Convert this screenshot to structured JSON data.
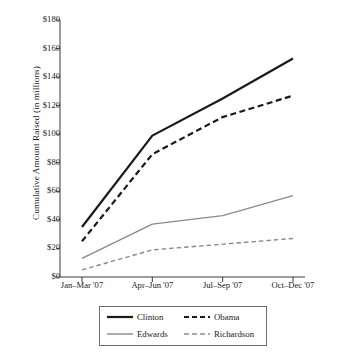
{
  "chart_data": {
    "type": "line",
    "title": "",
    "xlabel": "",
    "ylabel": "Cumulative Amount Raised (in millions)",
    "categories": [
      "Jan–Mar '07",
      "Apr–Jun '07",
      "Jul–Sep '07",
      "Oct–Dec '07"
    ],
    "ylim": [
      0,
      180
    ],
    "ytick_labels": [
      "$0",
      "$20",
      "$40",
      "$60",
      "$80",
      "$100",
      "$120",
      "$140",
      "$160",
      "$180"
    ],
    "ytick_values": [
      0,
      20,
      40,
      60,
      80,
      100,
      120,
      140,
      160,
      180
    ],
    "grid": false,
    "legend_position": "bottom",
    "series": [
      {
        "name": "Clinton",
        "values": [
          35,
          99,
          125,
          153
        ],
        "color": "#1a1a1a",
        "style": "solid",
        "width": 2.2
      },
      {
        "name": "Obama",
        "values": [
          25,
          86,
          112,
          127
        ],
        "color": "#1a1a1a",
        "style": "dashed",
        "width": 2.2
      },
      {
        "name": "Edwards",
        "values": [
          13,
          37,
          43,
          57
        ],
        "color": "#8a8a8a",
        "style": "solid",
        "width": 1.4
      },
      {
        "name": "Richardson",
        "values": [
          5,
          19,
          23,
          27
        ],
        "color": "#8a8a8a",
        "style": "dashed",
        "width": 1.4
      }
    ]
  },
  "legend": {
    "items": [
      {
        "label": "Clinton"
      },
      {
        "label": "Obama"
      },
      {
        "label": "Edwards"
      },
      {
        "label": "Richardson"
      }
    ]
  },
  "axis": {
    "y_title": "Cumulative Amount Raised (in millions)"
  }
}
